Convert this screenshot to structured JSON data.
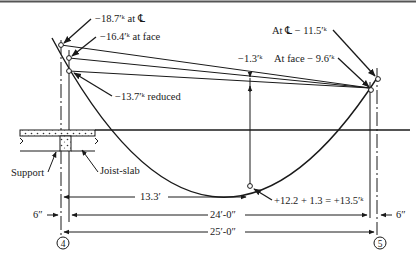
{
  "diagram": {
    "moments": {
      "left_centerline": "−18.7′ᵏ at ℄",
      "left_face": "−16.4′ᵏ at face",
      "left_reduced": "−13.7′ᵏ reduced",
      "right_centerline": "At ℄ − 11.5′ᵏ",
      "right_face": "At face − 9.6′ᵏ",
      "midspan_offset": "−1.3′ᵏ",
      "max_positive": "+12.2 + 1.3 = +13.5′ᵏ"
    },
    "labels": {
      "support": "Support",
      "joist_slab": "Joist-slab"
    },
    "dimensions": {
      "to_max_moment": "13.3′",
      "clear_span": "24′-0″",
      "center_span": "25′-0″",
      "left_half_support": "6″",
      "right_half_support": "6″"
    },
    "grid_markers": {
      "left": "4",
      "right": "5"
    }
  }
}
